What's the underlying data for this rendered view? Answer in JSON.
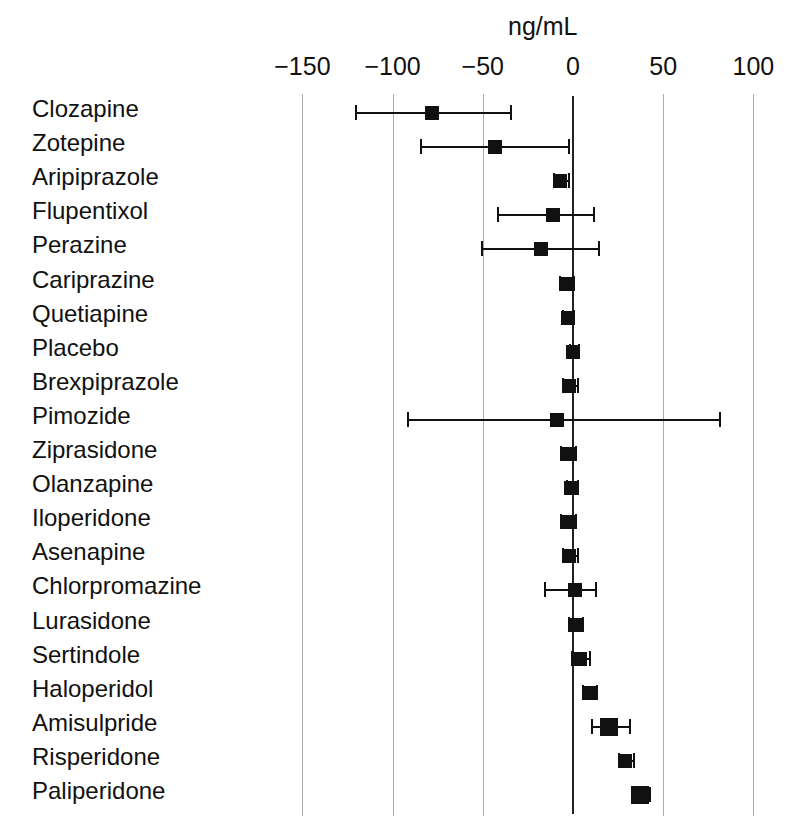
{
  "chart_data": {
    "type": "scatter",
    "subtype": "forest-plot",
    "title": "",
    "xlabel": "ng/mL",
    "ylabel": "",
    "unit_label": "ng/mL",
    "xlim": [
      -165,
      112
    ],
    "grid": true,
    "gridlines_at": [
      -150,
      -100,
      -50,
      50,
      100
    ],
    "reference_line": 0,
    "legend": "none",
    "xticks": [
      -150,
      -100,
      -50,
      0,
      50,
      100
    ],
    "xtick_labels": [
      "−150",
      "−100",
      "−50",
      "0",
      "50",
      "100"
    ],
    "categories": [
      "Clozapine",
      "Zotepine",
      "Aripiprazole",
      "Flupentixol",
      "Perazine",
      "Cariprazine",
      "Quetiapine",
      "Placebo",
      "Brexpiprazole",
      "Pimozide",
      "Ziprasidone",
      "Olanzapine",
      "Iloperidone",
      "Asenapine",
      "Chlorpromazine",
      "Lurasidone",
      "Sertindole",
      "Haloperidol",
      "Amisulpride",
      "Risperidone",
      "Paliperidone"
    ],
    "values": [
      -78,
      -43,
      -7,
      -11,
      -18,
      -4,
      -3,
      0,
      -2,
      -9,
      -3,
      -1,
      -3,
      -2,
      1,
      1,
      4,
      9,
      20,
      29,
      37
    ],
    "ci_lower": [
      -121,
      -85,
      -11,
      -42,
      -51,
      -8,
      -6,
      -2,
      -6,
      -92,
      -7,
      -4,
      -7,
      -6,
      -16,
      -3,
      -1,
      5,
      10,
      25,
      32
    ],
    "ci_upper": [
      -35,
      -3,
      -3,
      11,
      14,
      0,
      0,
      3,
      2,
      81,
      1,
      2,
      1,
      2,
      12,
      5,
      9,
      13,
      31,
      33,
      42
    ],
    "points": [
      {
        "label": "Clozapine",
        "value": -78,
        "ci_lower": -121,
        "ci_upper": -35,
        "marker_size": "medium"
      },
      {
        "label": "Zotepine",
        "value": -43,
        "ci_lower": -85,
        "ci_upper": -3,
        "marker_size": "medium"
      },
      {
        "label": "Aripiprazole",
        "value": -7,
        "ci_lower": -11,
        "ci_upper": -3,
        "marker_size": "medium"
      },
      {
        "label": "Flupentixol",
        "value": -11,
        "ci_lower": -42,
        "ci_upper": 11,
        "marker_size": "medium"
      },
      {
        "label": "Perazine",
        "value": -18,
        "ci_lower": -51,
        "ci_upper": 14,
        "marker_size": "medium"
      },
      {
        "label": "Cariprazine",
        "value": -4,
        "ci_lower": -8,
        "ci_upper": 0,
        "marker_size": "medium"
      },
      {
        "label": "Quetiapine",
        "value": -3,
        "ci_lower": -6,
        "ci_upper": 0,
        "marker_size": "medium"
      },
      {
        "label": "Placebo",
        "value": 0,
        "ci_lower": -2,
        "ci_upper": 3,
        "marker_size": "medium"
      },
      {
        "label": "Brexpiprazole",
        "value": -2,
        "ci_lower": -6,
        "ci_upper": 2,
        "marker_size": "medium"
      },
      {
        "label": "Pimozide",
        "value": -9,
        "ci_lower": -92,
        "ci_upper": 81,
        "marker_size": "medium"
      },
      {
        "label": "Ziprasidone",
        "value": -3,
        "ci_lower": -7,
        "ci_upper": 1,
        "marker_size": "medium"
      },
      {
        "label": "Olanzapine",
        "value": -1,
        "ci_lower": -4,
        "ci_upper": 2,
        "marker_size": "medium"
      },
      {
        "label": "Iloperidone",
        "value": -3,
        "ci_lower": -7,
        "ci_upper": 1,
        "marker_size": "medium"
      },
      {
        "label": "Asenapine",
        "value": -2,
        "ci_lower": -6,
        "ci_upper": 2,
        "marker_size": "medium"
      },
      {
        "label": "Chlorpromazine",
        "value": 1,
        "ci_lower": -16,
        "ci_upper": 12,
        "marker_size": "medium"
      },
      {
        "label": "Lurasidone",
        "value": 1,
        "ci_lower": -3,
        "ci_upper": 5,
        "marker_size": "medium"
      },
      {
        "label": "Sertindole",
        "value": 4,
        "ci_lower": -1,
        "ci_upper": 9,
        "marker_size": "medium"
      },
      {
        "label": "Haloperidol",
        "value": 9,
        "ci_lower": 5,
        "ci_upper": 13,
        "marker_size": "medium"
      },
      {
        "label": "Amisulpride",
        "value": 20,
        "ci_lower": 10,
        "ci_upper": 31,
        "marker_size": "large"
      },
      {
        "label": "Risperidone",
        "value": 29,
        "ci_lower": 25,
        "ci_upper": 33,
        "marker_size": "medium"
      },
      {
        "label": "Paliperidone",
        "value": 37,
        "ci_lower": 32,
        "ci_upper": 42,
        "marker_size": "large"
      }
    ],
    "colors": {
      "marker": "#111111",
      "ci_line": "#111111",
      "gridline": "#aaaaaa",
      "reference_line": "#222222",
      "text": "#111111",
      "background": "#ffffff"
    }
  },
  "geometry": {
    "x_zero_px": 573,
    "px_per_unit": 1.804,
    "row_top_px": 113,
    "row_step_px": 34.1,
    "label_x_px": 32,
    "marker_half_medium": 7,
    "marker_half_large": 9
  }
}
